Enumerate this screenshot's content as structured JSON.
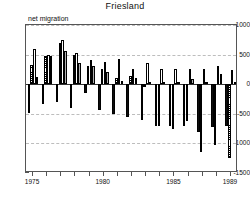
{
  "chart_data": {
    "type": "bar",
    "title": "Friesland",
    "ylabel": "net migration",
    "xlabel": "",
    "ylim": [
      -1500,
      1000
    ],
    "yticks": [
      1000,
      500,
      0,
      -500,
      -1000,
      -1500
    ],
    "ytick_labels": [
      "1000",
      "500",
      "0",
      "-500",
      "-1000",
      "-1500"
    ],
    "grid": true,
    "grid_axis": "y",
    "legend": "none",
    "xlim": [
      1974.5,
      1989.5
    ],
    "xticks": [
      1975,
      1976,
      1977,
      1978,
      1979,
      1980,
      1981,
      1982,
      1983,
      1984,
      1985,
      1986,
      1987,
      1988,
      1989
    ],
    "xtick_labels_shown": [
      "1975",
      "1980",
      "1985",
      "1989"
    ],
    "xtick_labels_shown_at": [
      1975,
      1980,
      1985,
      1989
    ],
    "categories": [
      1975,
      1976,
      1977,
      1978,
      1979,
      1980,
      1981,
      1982,
      1983,
      1984,
      1985,
      1986,
      1987,
      1988,
      1989
    ],
    "series": [
      {
        "name": "series-1",
        "fill": "solid-black",
        "values": [
          -490,
          -340,
          -300,
          -400,
          -150,
          -440,
          -500,
          -560,
          -600,
          -700,
          -700,
          -700,
          -800,
          -720,
          -700
        ]
      },
      {
        "name": "series-2",
        "fill": "hatched",
        "values": [
          320,
          480,
          700,
          500,
          300,
          260,
          110,
          140,
          -40,
          -700,
          -760,
          -620,
          -1150,
          -1020,
          -1250
        ]
      },
      {
        "name": "series-3",
        "fill": "open-white",
        "values": [
          590,
          490,
          740,
          530,
          410,
          370,
          420,
          250,
          360,
          250,
          250,
          250,
          250,
          310,
          240
        ]
      },
      {
        "name": "series-4",
        "fill": "gray",
        "values": [
          120,
          470,
          560,
          360,
          300,
          200,
          60,
          100,
          40,
          30,
          30,
          80,
          30,
          170,
          30
        ]
      }
    ]
  }
}
